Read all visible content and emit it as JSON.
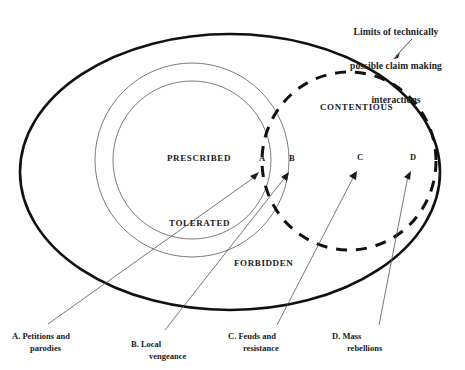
{
  "diagram": {
    "title_lines": [
      "Limits of technically",
      "possible claim making",
      "interactions"
    ],
    "zones": {
      "prescribed": "PRESCRIBED",
      "tolerated": "TOLERATED",
      "forbidden": "FORBIDDEN",
      "contentious": "CONTENTIOUS"
    },
    "markers": {
      "a": "A",
      "b": "B",
      "c": "C",
      "d": "D"
    },
    "legend": [
      {
        "key": "A.",
        "line1": "Petitions and",
        "line2": "parodies"
      },
      {
        "key": "B.",
        "line1": "Local",
        "line2": "vengeance"
      },
      {
        "key": "C.",
        "line1": "Feuds and",
        "line2": "resistance"
      },
      {
        "key": "D.",
        "line1": "Mass",
        "line2": "rebellions"
      }
    ],
    "colors": {
      "background": "#fefefe",
      "stroke_heavy": "#111111",
      "stroke_thin": "#555555",
      "stroke_dashed": "#111111",
      "text": "#222222"
    }
  }
}
